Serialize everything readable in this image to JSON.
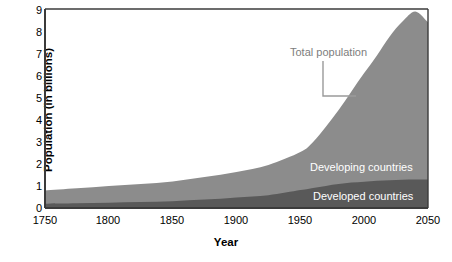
{
  "chart_data": {
    "type": "area",
    "title": "",
    "xlabel": "Year",
    "ylabel": "Population (in billions)",
    "stacked": true,
    "grid": false,
    "legend_position": "inline-annotations",
    "xlim": [
      1750,
      2050
    ],
    "ylim": [
      0,
      9
    ],
    "xticks": [
      "1750",
      "1800",
      "1850",
      "1900",
      "1950",
      "2000",
      "2050"
    ],
    "xtick_values": [
      1750,
      1800,
      1850,
      1900,
      1950,
      2000,
      2050
    ],
    "yticks": [
      "0",
      "1",
      "2",
      "3",
      "4",
      "5",
      "6",
      "7",
      "8",
      "9"
    ],
    "ytick_values": [
      0,
      1,
      2,
      3,
      4,
      5,
      6,
      7,
      8,
      9
    ],
    "x": [
      1750,
      1775,
      1800,
      1825,
      1850,
      1875,
      1900,
      1925,
      1950,
      1960,
      1970,
      1980,
      1990,
      2000,
      2010,
      2020,
      2030,
      2040,
      2050
    ],
    "series": [
      {
        "name": "Developed countries",
        "color": "#595959",
        "values": [
          0.19,
          0.21,
          0.24,
          0.27,
          0.31,
          0.38,
          0.48,
          0.58,
          0.81,
          0.91,
          1.0,
          1.08,
          1.15,
          1.19,
          1.23,
          1.26,
          1.28,
          1.29,
          1.29
        ]
      },
      {
        "name": "Developing countries",
        "color": "#8c8c8c",
        "values": [
          0.6,
          0.68,
          0.76,
          0.81,
          0.89,
          1.02,
          1.15,
          1.37,
          1.72,
          2.08,
          2.68,
          3.35,
          4.12,
          4.91,
          5.67,
          6.5,
          7.15,
          7.6,
          7.11
        ]
      }
    ],
    "total_series": {
      "name": "Total population",
      "values": [
        0.79,
        0.89,
        1.0,
        1.08,
        1.2,
        1.4,
        1.63,
        1.95,
        2.53,
        2.99,
        3.68,
        4.43,
        5.27,
        6.1,
        6.9,
        7.76,
        8.43,
        8.89,
        8.4
      ]
    },
    "annotations": [
      {
        "name": "total-population",
        "text": "Total population",
        "color": "#7d7d7d"
      },
      {
        "name": "developing-countries",
        "text": "Developing countries",
        "color": "#ffffff"
      },
      {
        "name": "developed-countries",
        "text": "Developed countries",
        "color": "#ffffff"
      }
    ]
  },
  "axes": {
    "ylabel": "Population (in billions)",
    "xlabel": "Year",
    "yticks": [
      "9",
      "8",
      "7",
      "6",
      "5",
      "4",
      "3",
      "2",
      "1",
      "0"
    ],
    "xticks": [
      "1750",
      "1800",
      "1850",
      "1900",
      "1950",
      "2000",
      "2050"
    ]
  },
  "labels": {
    "total_population": "Total population",
    "developing_countries": "Developing countries",
    "developed_countries": "Developed countries"
  },
  "colors": {
    "developed": "#595959",
    "developing": "#8c8c8c",
    "axis": "#3b3b3b",
    "annotation": "#7d7d7d",
    "background": "#ffffff"
  }
}
